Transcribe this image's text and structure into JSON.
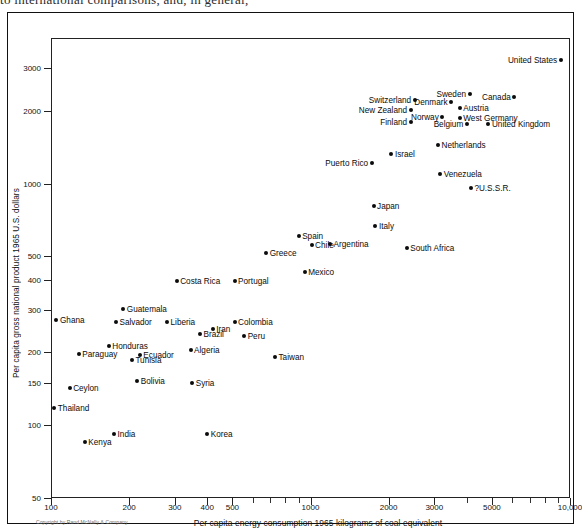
{
  "page_header_text": "to international comparisons, and, in general,",
  "figure": {
    "copyright": "Copyright by Rand McNally & Company"
  },
  "chart_data": {
    "type": "scatter",
    "title": "",
    "xlabel": "Per capita energy consumption 1965 kilograms of coal equivalent",
    "ylabel": "Per capita gross national product 1965 U.S. dollars",
    "xscale": "log",
    "yscale": "log",
    "xlim": [
      100,
      10000
    ],
    "ylim": [
      50,
      4000
    ],
    "grid": false,
    "legend": "none",
    "xticks": [
      100,
      200,
      300,
      400,
      500,
      1000,
      2000,
      3000,
      5000,
      10000
    ],
    "xtick_labels": [
      "100",
      "200",
      "300",
      "400",
      "500",
      "1000",
      "2000",
      "3000",
      "5000",
      "10,000"
    ],
    "xminor_ticks": [
      600,
      700,
      800,
      900,
      4000,
      6000,
      7000,
      8000,
      9000
    ],
    "yticks": [
      50,
      100,
      150,
      200,
      300,
      400,
      500,
      1000,
      2000,
      3000
    ],
    "ytick_labels": [
      "50",
      "100",
      "150",
      "200",
      "300",
      "400",
      "500",
      "1000",
      "2000",
      "3000"
    ],
    "points": [
      {
        "name": "United States",
        "x": 9200,
        "y": 3240,
        "label_side": "left"
      },
      {
        "name": "Canada",
        "x": 6100,
        "y": 2280,
        "label_side": "left"
      },
      {
        "name": "Sweden",
        "x": 4100,
        "y": 2340,
        "label_side": "left"
      },
      {
        "name": "Denmark",
        "x": 3480,
        "y": 2170,
        "label_side": "left"
      },
      {
        "name": "Austria",
        "x": 3760,
        "y": 2060,
        "label_side": "right"
      },
      {
        "name": "Switzerland",
        "x": 2520,
        "y": 2220,
        "label_side": "left"
      },
      {
        "name": "New Zealand",
        "x": 2430,
        "y": 2020,
        "label_side": "left"
      },
      {
        "name": "Norway",
        "x": 3220,
        "y": 1880,
        "label_side": "left"
      },
      {
        "name": "West Germany",
        "x": 3760,
        "y": 1870,
        "label_side": "right"
      },
      {
        "name": "Finland",
        "x": 2430,
        "y": 1790,
        "label_side": "left"
      },
      {
        "name": "Belgium",
        "x": 4000,
        "y": 1760,
        "label_side": "left"
      },
      {
        "name": "United Kingdom",
        "x": 4850,
        "y": 1760,
        "label_side": "right"
      },
      {
        "name": "Netherlands",
        "x": 3100,
        "y": 1440,
        "label_side": "right"
      },
      {
        "name": "Israel",
        "x": 2050,
        "y": 1320,
        "label_side": "right"
      },
      {
        "name": "Puerto Rico",
        "x": 1720,
        "y": 1220,
        "label_side": "left"
      },
      {
        "name": "Venezuela",
        "x": 3160,
        "y": 1090,
        "label_side": "right"
      },
      {
        "name": "?U.S.S.R.",
        "x": 4150,
        "y": 960,
        "label_side": "right"
      },
      {
        "name": "Japan",
        "x": 1750,
        "y": 810,
        "label_side": "right"
      },
      {
        "name": "Italy",
        "x": 1780,
        "y": 670,
        "label_side": "right"
      },
      {
        "name": "Spain",
        "x": 900,
        "y": 605,
        "label_side": "right"
      },
      {
        "name": "Argentina",
        "x": 1190,
        "y": 560,
        "label_side": "right"
      },
      {
        "name": "Chile",
        "x": 1010,
        "y": 555,
        "label_side": "right"
      },
      {
        "name": "South Africa",
        "x": 2350,
        "y": 540,
        "label_side": "right"
      },
      {
        "name": "Greece",
        "x": 675,
        "y": 515,
        "label_side": "right"
      },
      {
        "name": "Mexico",
        "x": 950,
        "y": 430,
        "label_side": "right"
      },
      {
        "name": "Costa Rica",
        "x": 305,
        "y": 395,
        "label_side": "right"
      },
      {
        "name": "Portugal",
        "x": 510,
        "y": 395,
        "label_side": "right"
      },
      {
        "name": "Guatemala",
        "x": 190,
        "y": 302,
        "label_side": "right"
      },
      {
        "name": "Ghana",
        "x": 105,
        "y": 272,
        "label_side": "right"
      },
      {
        "name": "Salvador",
        "x": 178,
        "y": 268,
        "label_side": "right"
      },
      {
        "name": "Liberia",
        "x": 280,
        "y": 268,
        "label_side": "right"
      },
      {
        "name": "Colombia",
        "x": 510,
        "y": 268,
        "label_side": "right"
      },
      {
        "name": "Iran",
        "x": 420,
        "y": 250,
        "label_side": "right"
      },
      {
        "name": "Brazil",
        "x": 375,
        "y": 238,
        "label_side": "right"
      },
      {
        "name": "Peru",
        "x": 555,
        "y": 235,
        "label_side": "right"
      },
      {
        "name": "Honduras",
        "x": 167,
        "y": 212,
        "label_side": "right"
      },
      {
        "name": "Algeria",
        "x": 345,
        "y": 205,
        "label_side": "right"
      },
      {
        "name": "Paraguay",
        "x": 128,
        "y": 198,
        "label_side": "right"
      },
      {
        "name": "Ecuador",
        "x": 220,
        "y": 196,
        "label_side": "right"
      },
      {
        "name": "Taiwan",
        "x": 730,
        "y": 192,
        "label_side": "right"
      },
      {
        "name": "Tunisia",
        "x": 205,
        "y": 186,
        "label_side": "right"
      },
      {
        "name": "Bolivia",
        "x": 215,
        "y": 152,
        "label_side": "right"
      },
      {
        "name": "Syria",
        "x": 350,
        "y": 150,
        "label_side": "right"
      },
      {
        "name": "Ceylon",
        "x": 118,
        "y": 142,
        "label_side": "right"
      },
      {
        "name": "Thailand",
        "x": 103,
        "y": 118,
        "label_side": "right"
      },
      {
        "name": "India",
        "x": 175,
        "y": 92,
        "label_side": "right"
      },
      {
        "name": "Korea",
        "x": 400,
        "y": 92,
        "label_side": "right"
      },
      {
        "name": "Kenya",
        "x": 135,
        "y": 85,
        "label_side": "right"
      }
    ]
  }
}
